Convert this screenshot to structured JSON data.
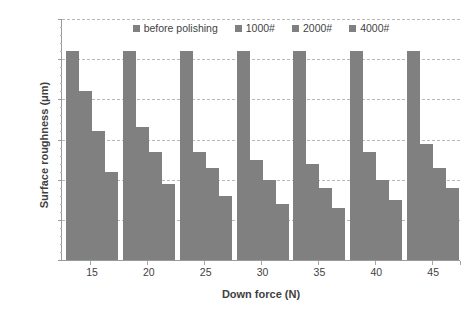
{
  "chart_data": {
    "type": "bar",
    "title": "",
    "xlabel": "Down force (N)",
    "ylabel": "Surface roughness (μm)",
    "categories": [
      "15",
      "20",
      "25",
      "30",
      "35",
      "40",
      "45"
    ],
    "series": [
      {
        "name": "before polishing",
        "color": "#808080",
        "values": [
          0.052,
          0.052,
          0.052,
          0.052,
          0.052,
          0.052,
          0.052
        ]
      },
      {
        "name": "1000#",
        "color": "#808080",
        "values": [
          0.042,
          0.033,
          0.027,
          0.025,
          0.024,
          0.027,
          0.029
        ]
      },
      {
        "name": "2000#",
        "color": "#808080",
        "values": [
          0.032,
          0.027,
          0.023,
          0.02,
          0.018,
          0.02,
          0.023
        ]
      },
      {
        "name": "4000#",
        "color": "#808080",
        "values": [
          0.022,
          0.019,
          0.016,
          0.014,
          0.013,
          0.015,
          0.018
        ]
      }
    ],
    "ylim": [
      0,
      0.06
    ],
    "yticks": [
      0,
      0.01,
      0.02,
      0.03,
      0.04,
      0.05,
      0.06
    ],
    "ytick_labels": [
      "0",
      "0.01",
      "0.02",
      "0.03",
      "0.04",
      "0.05",
      "0.06"
    ],
    "grid": true,
    "grid_axis": "y",
    "grid_style": "dashed",
    "legend_position": "top-center",
    "bar_color": "#808080",
    "axis_color": "#9a9a9a",
    "grid_color": "#b9b9b9",
    "text_color": "#3f3f3f",
    "background": "#ffffff"
  },
  "axes": {
    "y_title": "Surface roughness (μm)",
    "x_title": "Down force (N)"
  },
  "legend": {
    "items": [
      {
        "label": "before polishing"
      },
      {
        "label": "1000#"
      },
      {
        "label": "2000#"
      },
      {
        "label": "4000#"
      }
    ]
  }
}
